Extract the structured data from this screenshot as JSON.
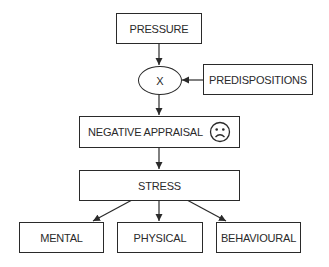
{
  "diagram": {
    "nodes": {
      "pressure": "PRESSURE",
      "multiply": "X",
      "predispositions": "PREDISPOSITIONS",
      "negative_appraisal": "NEGATIVE APPRAISAL",
      "negative_appraisal_icon": "sad-face-icon",
      "stress": "STRESS",
      "mental": "MENTAL",
      "physical": "PHYSICAL",
      "behavioural": "BEHAVIOURAL"
    },
    "edges": [
      {
        "from": "PRESSURE",
        "to": "X"
      },
      {
        "from": "PREDISPOSITIONS",
        "to": "X"
      },
      {
        "from": "X",
        "to": "NEGATIVE APPRAISAL"
      },
      {
        "from": "NEGATIVE APPRAISAL",
        "to": "STRESS"
      },
      {
        "from": "STRESS",
        "to": "MENTAL"
      },
      {
        "from": "STRESS",
        "to": "PHYSICAL"
      },
      {
        "from": "STRESS",
        "to": "BEHAVIOURAL"
      }
    ],
    "colors": {
      "line": "#2a2a2a",
      "background": "#ffffff"
    }
  }
}
